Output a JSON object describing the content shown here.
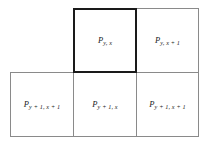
{
  "diagram": {
    "type": "pixel-neighborhood-grid",
    "cells": [
      {
        "id": "top-current",
        "symbol": "P",
        "subscript": "y, x",
        "row": "top",
        "column": "middle",
        "highlighted": true,
        "border_color": "#1a1a1a",
        "border_width_px": 2
      },
      {
        "id": "top-right",
        "symbol": "P",
        "subscript": "y, x + 1",
        "row": "top",
        "column": "right",
        "highlighted": false,
        "border_color": "#8a8a8a",
        "border_width_px": 1
      },
      {
        "id": "bottom-left",
        "symbol": "P",
        "subscript": "y + 1, x + 1",
        "row": "bottom",
        "column": "left",
        "highlighted": false,
        "border_color": "#8a8a8a",
        "border_width_px": 1
      },
      {
        "id": "bottom-middle",
        "symbol": "P",
        "subscript": "y + 1, x",
        "row": "bottom",
        "column": "middle",
        "highlighted": false,
        "border_color": "#8a8a8a",
        "border_width_px": 1
      },
      {
        "id": "bottom-right",
        "symbol": "P",
        "subscript": "y + 1, x + 1",
        "row": "bottom",
        "column": "right",
        "highlighted": false,
        "border_color": "#8a8a8a",
        "border_width_px": 1
      }
    ],
    "colors": {
      "background": "#ffffff",
      "thin_border": "#8a8a8a",
      "bold_border": "#1a1a1a",
      "text": "#1a1a1a"
    }
  }
}
